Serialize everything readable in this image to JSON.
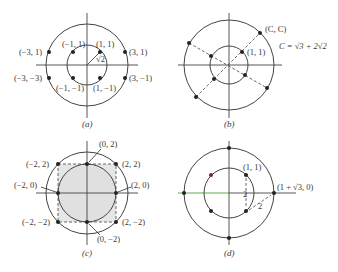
{
  "figure": {
    "panels": [
      {
        "id": "a",
        "caption": "(a)",
        "labels": {
          "p_m1_1": "(−1, 1)",
          "p_1_1": "(1, 1)",
          "p_m3_1": "(−3, 1)",
          "p_3_1": "(3, 1)",
          "p_m3_m3": "(−3, −3)",
          "p_3_m1": "(3, −1)",
          "p_m1_m1": "(−1, −1)",
          "p_1_m1": "(1, −1)",
          "radius": "√2"
        }
      },
      {
        "id": "b",
        "caption": "(b)",
        "labels": {
          "p_c_c": "(C, C)",
          "p_1_1": "(1, 1)",
          "formula": "C = √3 + 2√2"
        }
      },
      {
        "id": "c",
        "caption": "(c)",
        "labels": {
          "p_0_2": "(0, 2)",
          "p_m2_2": "(−2, 2)",
          "p_2_2": "(2, 2)",
          "p_m2_0": "(−2, 0)",
          "p_2_0": "(2, 0)",
          "p_m2_m2": "(−2, −2)",
          "p_2_m2": "(2, −2)",
          "p_0_m2": "(0, −2)"
        }
      },
      {
        "id": "d",
        "caption": "(d)",
        "labels": {
          "p_1_1": "(1, 1)",
          "p_1s3_0": "(1 + √3, 0)",
          "dist_vertical": "2",
          "dist_diag": "2"
        }
      }
    ]
  }
}
